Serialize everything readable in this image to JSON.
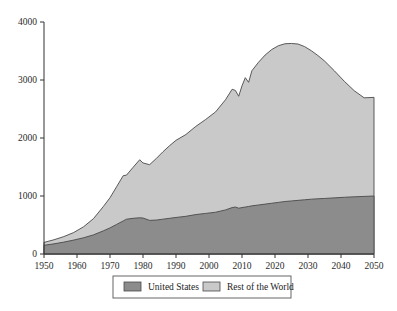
{
  "chart_data": {
    "type": "area",
    "stacked": true,
    "title": "",
    "subtitle": "",
    "xlabel": "",
    "ylabel": "",
    "xlim": [
      1950,
      2050
    ],
    "ylim": [
      0,
      4000
    ],
    "grid": false,
    "legend_position": "bottom",
    "x_ticks": [
      1950,
      1960,
      1970,
      1980,
      1990,
      2000,
      2010,
      2020,
      2030,
      2040,
      2050
    ],
    "x_tick_labels": [
      "1950",
      "1960",
      "1970",
      "1980",
      "1990",
      "2000",
      "2010",
      "2020",
      "2030",
      "2040",
      "2050"
    ],
    "y_ticks": [
      0,
      1000,
      2000,
      3000,
      4000
    ],
    "y_tick_labels": [
      "0",
      "1000",
      "2000",
      "3000",
      "4000"
    ],
    "colors": {
      "united_states": "#8c8c8c",
      "rest_of_world": "#c9c9c9",
      "outline": "#4a4a4a",
      "axis": "#333333",
      "text": "#2b2b2b"
    },
    "legend": [
      {
        "label": "United States",
        "color": "#8c8c8c"
      },
      {
        "label": "Rest of the World",
        "color": "#c9c9c9"
      }
    ],
    "x": [
      1950,
      1953,
      1956,
      1959,
      1962,
      1965,
      1968,
      1970,
      1972,
      1974,
      1975,
      1977,
      1979,
      1980,
      1982,
      1984,
      1986,
      1988,
      1990,
      1993,
      1996,
      1999,
      2002,
      2005,
      2007,
      2008,
      2009,
      2010,
      2011,
      2012,
      2013,
      2015,
      2017,
      2019,
      2021,
      2023,
      2025,
      2027,
      2029,
      2031,
      2033,
      2035,
      2038,
      2041,
      2044,
      2047,
      2050
    ],
    "series": [
      {
        "name": "United States",
        "color": "#8c8c8c",
        "values": [
          150,
          175,
          205,
          240,
          280,
          330,
          400,
          450,
          510,
          570,
          600,
          615,
          625,
          620,
          580,
          585,
          600,
          615,
          630,
          650,
          680,
          700,
          720,
          760,
          800,
          810,
          790,
          800,
          810,
          820,
          830,
          845,
          860,
          875,
          890,
          905,
          915,
          925,
          935,
          945,
          952,
          958,
          968,
          978,
          986,
          993,
          1000
        ]
      },
      {
        "name": "Rest of the World",
        "color": "#c9c9c9",
        "values": [
          50,
          70,
          95,
          130,
          190,
          280,
          420,
          520,
          650,
          780,
          760,
          880,
          1000,
          950,
          960,
          1060,
          1160,
          1250,
          1330,
          1410,
          1520,
          1620,
          1730,
          1900,
          2040,
          2010,
          1930,
          2100,
          2230,
          2140,
          2330,
          2460,
          2570,
          2650,
          2700,
          2720,
          2715,
          2695,
          2640,
          2560,
          2470,
          2370,
          2190,
          2000,
          1830,
          1700,
          1700
        ]
      }
    ],
    "totals": [
      200,
      245,
      300,
      370,
      470,
      610,
      820,
      970,
      1160,
      1350,
      1360,
      1495,
      1625,
      1570,
      1540,
      1645,
      1760,
      1865,
      1960,
      2060,
      2200,
      2320,
      2450,
      2660,
      2840,
      2820,
      2720,
      2900,
      3040,
      2960,
      3160,
      3305,
      3430,
      3525,
      3590,
      3625,
      3630,
      3620,
      3575,
      3505,
      3422,
      3328,
      3158,
      2978,
      2816,
      2693,
      2700
    ]
  }
}
